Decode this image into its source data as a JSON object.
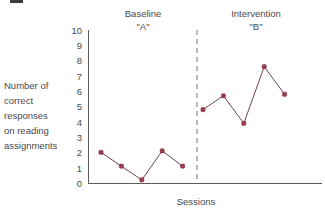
{
  "chart_data": {
    "type": "line",
    "title": "",
    "xlabel": "Sessions",
    "ylabel": "Number of correct responses on reading assignments",
    "ylim": [
      0,
      10
    ],
    "yticks": [
      "0",
      "1",
      "2",
      "3",
      "4",
      "5",
      "6",
      "7",
      "8",
      "9",
      "10"
    ],
    "grid": false,
    "legend": "none",
    "phases": [
      {
        "name": "Baseline",
        "condition": "\"A\"",
        "x": [
          1,
          2,
          3,
          4,
          5
        ],
        "values": [
          2.0,
          1.1,
          0.2,
          2.1,
          1.1
        ]
      },
      {
        "name": "Intervention",
        "condition": "\"B\"",
        "x": [
          6,
          7,
          8,
          9,
          10
        ],
        "values": [
          4.8,
          5.7,
          3.9,
          7.6,
          5.8
        ]
      }
    ],
    "phase_divider_after_x": 5,
    "marker_color": "#9b3b50",
    "line_color": "#6b4550",
    "axis_color": "#5c5c5c"
  },
  "ylabel_lines": [
    "Number of",
    "correct",
    "responses",
    "on reading",
    "assignments"
  ],
  "phase_a": {
    "name": "Baseline",
    "condition": "\"A\""
  },
  "phase_b": {
    "name": "Intervention",
    "condition": "\"B\""
  },
  "xaxis": {
    "title": "Sessions"
  },
  "yticks": {
    "t10": "10",
    "t9": "9",
    "t8": "8",
    "t7": "7",
    "t6": "6",
    "t5": "5",
    "t4": "4",
    "t3": "3",
    "t2": "2",
    "t1": "1",
    "t0": "0"
  }
}
